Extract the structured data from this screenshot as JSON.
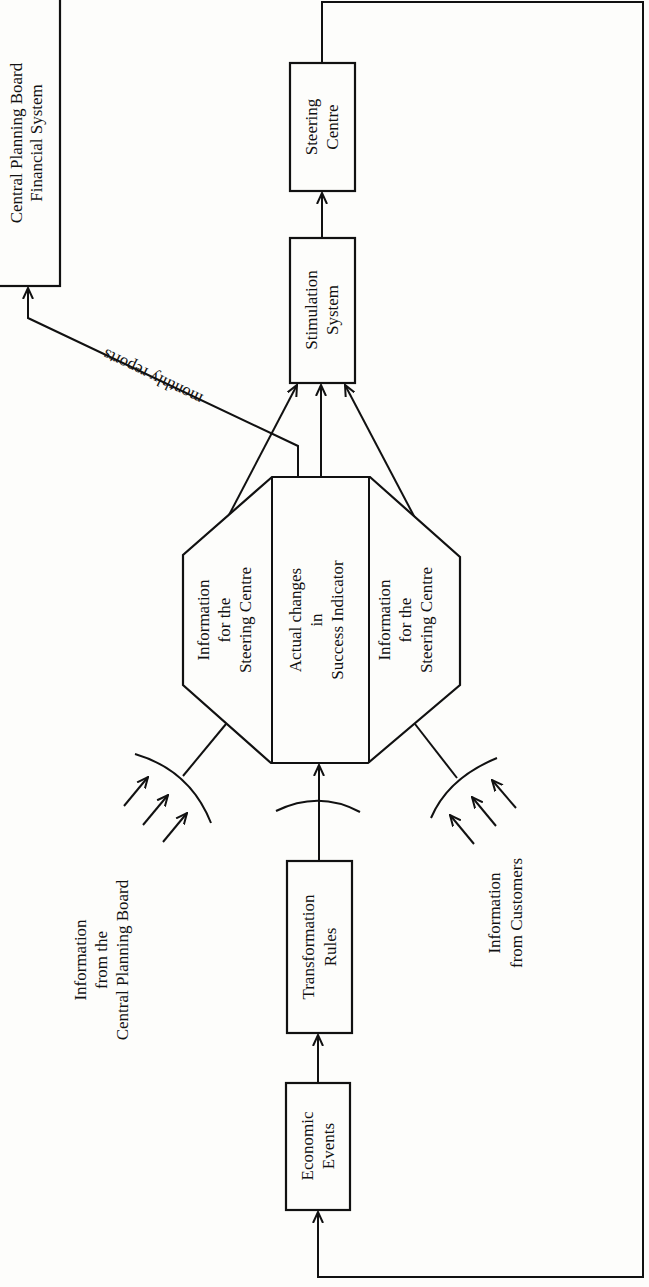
{
  "diagram": {
    "orientation": "rotated -90deg (read with page turned clockwise)",
    "boxes": {
      "cpb_financial": {
        "lines": [
          "Central Planning Board",
          "Financial System"
        ]
      },
      "steering_centre": {
        "lines": [
          "Steering",
          "Centre"
        ]
      },
      "stimulation_system": {
        "lines": [
          "Stimulation",
          "System"
        ]
      },
      "transformation_rules": {
        "lines": [
          "Transformation",
          "Rules"
        ]
      },
      "economic_events": {
        "lines": [
          "Economic",
          "Events"
        ]
      }
    },
    "octagon": {
      "left_panel": {
        "lines": [
          "Information",
          "for the",
          "Steering Centre"
        ]
      },
      "center_panel": {
        "lines": [
          "Actual changes",
          "in",
          "Success Indicator"
        ]
      },
      "right_panel": {
        "lines": [
          "Information",
          "for the",
          "Steering Centre"
        ]
      }
    },
    "labels": {
      "monthly_reports": "monthly reports",
      "info_cpb": {
        "lines": [
          "Information",
          "from the",
          "Central Planning Board"
        ]
      },
      "info_customers": {
        "lines": [
          "Information",
          "from Customers"
        ]
      }
    },
    "edges": [
      {
        "from": "Economic Events",
        "to": "Transformation Rules"
      },
      {
        "from": "Transformation Rules",
        "to": "Actual changes in Success Indicator"
      },
      {
        "from": "Information for the Steering Centre (left)",
        "to": "Stimulation System"
      },
      {
        "from": "Actual changes in Success Indicator",
        "to": "Stimulation System"
      },
      {
        "from": "Information for the Steering Centre (right)",
        "to": "Stimulation System"
      },
      {
        "from": "Stimulation System",
        "to": "Steering Centre"
      },
      {
        "from": "Actual changes in Success Indicator",
        "to": "Central Planning Board Financial System",
        "label": "monthly reports"
      },
      {
        "from": "Steering Centre",
        "to": "Economic Events",
        "label": "feedback loop"
      },
      {
        "from": "Information from the Central Planning Board",
        "to": "Information for the Steering Centre (left)"
      },
      {
        "from": "Information from Customers",
        "to": "Information for the Steering Centre (right)"
      }
    ]
  }
}
